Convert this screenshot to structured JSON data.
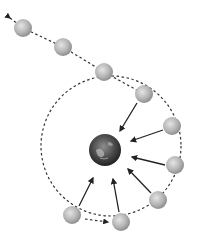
{
  "diagram": {
    "type": "orbital-capture",
    "colors": {
      "background": "#ffffff",
      "path": "#333333",
      "arrow": "#222222",
      "moon_light": "#d8d8d8",
      "moon_dark": "#8a8a8a",
      "planet_light": "#9a9a9a",
      "planet_dark": "#1e1e1e"
    },
    "planet": {
      "name": "planet",
      "cx": 105,
      "cy": 150,
      "r": 16
    },
    "moons": [
      {
        "cx": 23,
        "cy": 28
      },
      {
        "cx": 63,
        "cy": 47
      },
      {
        "cx": 104,
        "cy": 72
      },
      {
        "cx": 144,
        "cy": 94
      },
      {
        "cx": 172,
        "cy": 126
      },
      {
        "cx": 175,
        "cy": 165
      },
      {
        "cx": 158,
        "cy": 200
      },
      {
        "cx": 121,
        "cy": 222
      },
      {
        "cx": 72,
        "cy": 215
      }
    ],
    "moon_radius": 9,
    "escape_arrow": {
      "x": 8,
      "y": 17
    },
    "orbit": {
      "cx": 111,
      "cy": 146,
      "r": 70
    }
  }
}
